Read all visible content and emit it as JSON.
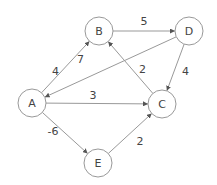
{
  "graph": {
    "type": "directed-weighted",
    "nodes": [
      {
        "id": "A",
        "label": "A",
        "x": 32,
        "y": 103
      },
      {
        "id": "B",
        "label": "B",
        "x": 99,
        "y": 31
      },
      {
        "id": "C",
        "label": "C",
        "x": 162,
        "y": 104
      },
      {
        "id": "D",
        "label": "D",
        "x": 189,
        "y": 31
      },
      {
        "id": "E",
        "label": "E",
        "x": 98,
        "y": 163
      }
    ],
    "edges": [
      {
        "from": "A",
        "to": "B",
        "weight": "4"
      },
      {
        "from": "B",
        "to": "D",
        "weight": "5"
      },
      {
        "from": "D",
        "to": "A",
        "weight": "7"
      },
      {
        "from": "C",
        "to": "B",
        "weight": "2"
      },
      {
        "from": "D",
        "to": "C",
        "weight": "4"
      },
      {
        "from": "A",
        "to": "C",
        "weight": "3"
      },
      {
        "from": "A",
        "to": "E",
        "weight": "-6"
      },
      {
        "from": "E",
        "to": "C",
        "weight": "2"
      }
    ]
  }
}
